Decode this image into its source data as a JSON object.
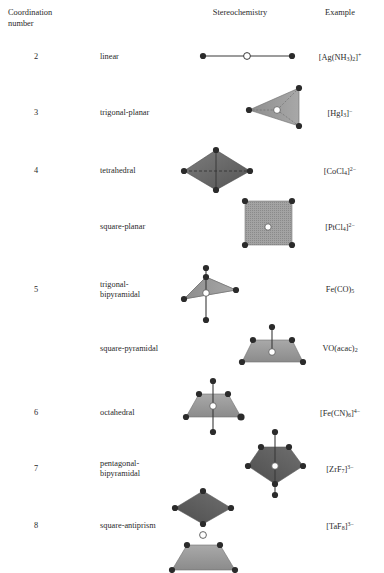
{
  "header": {
    "coordination_number": "Coordination\nnumber",
    "stereochemistry": "Stereochemistry",
    "example": "Example"
  },
  "colors": {
    "vertex": "#2b2b2b",
    "center_fill": "#ffffff",
    "face_light": "#b0b0b0",
    "face_mid": "#9a9a9a",
    "face_dark": "#6e6e6e",
    "bond": "#3a3a3a",
    "text": "#2a2a2a",
    "background": "#ffffff"
  },
  "rows": [
    {
      "number": "2",
      "geometry": "linear",
      "example_html": "[Ag(NH<sub>3</sub>)<sub>2</sub>]<sup>+</sup>",
      "example_plain": "[Ag(NH3)2]+",
      "shape": "linear",
      "number_y": 52,
      "geometry_y": 52,
      "example_y": 52
    },
    {
      "number": "3",
      "geometry": "trigonal-planar",
      "example_html": "[HgI<sub>3</sub>]<sup>−</sup>",
      "example_plain": "[HgI3]-",
      "shape": "trigonal-planar",
      "number_y": 108,
      "geometry_y": 108,
      "example_y": 108
    },
    {
      "number": "4",
      "geometry": "tetrahedral",
      "example_html": "[CoCl<sub>4</sub>]<sup>2−</sup>",
      "example_plain": "[CoCl4]2-",
      "shape": "tetrahedral",
      "number_y": 166,
      "geometry_y": 166,
      "example_y": 166
    },
    {
      "number": "",
      "geometry": "square-planar",
      "example_html": "[PtCl<sub>4</sub>]<sup>2−</sup>",
      "example_plain": "[PtCl4]2-",
      "shape": "square-planar",
      "number_y": 222,
      "geometry_y": 222,
      "example_y": 222
    },
    {
      "number": "5",
      "geometry": "trigonal-\nbipyramidal",
      "example_html": "Fe(CO)<sub>5</sub>",
      "example_plain": "Fe(CO)5",
      "shape": "trigonal-bipyramidal",
      "number_y": 285,
      "geometry_y": 280,
      "example_y": 285
    },
    {
      "number": "",
      "geometry": "square-pyramidal",
      "example_html": "VO(acac)<sub>2</sub>",
      "example_plain": "VO(acac)2",
      "shape": "square-pyramidal",
      "number_y": 344,
      "geometry_y": 344,
      "example_y": 344
    },
    {
      "number": "6",
      "geometry": "octahedral",
      "example_html": "[Fe(CN)<sub>6</sub>]<sup>4−</sup>",
      "example_plain": "[Fe(CN)6]4-",
      "shape": "octahedral",
      "number_y": 408,
      "geometry_y": 408,
      "example_y": 408
    },
    {
      "number": "7",
      "geometry": "pentagonal-\nbipyramidal",
      "example_html": "[ZrF<sub>7</sub>]<sup>3−</sup>",
      "example_plain": "[ZrF7]3-",
      "shape": "pentagonal-bipyramidal",
      "number_y": 464,
      "geometry_y": 459,
      "example_y": 464
    },
    {
      "number": "8",
      "geometry": "square-antiprism",
      "example_html": "[TaF<sub>8</sub>]<sup>3−</sup>",
      "example_plain": "[TaF8]3-",
      "shape": "square-antiprism",
      "number_y": 521,
      "geometry_y": 521,
      "example_y": 521
    }
  ]
}
